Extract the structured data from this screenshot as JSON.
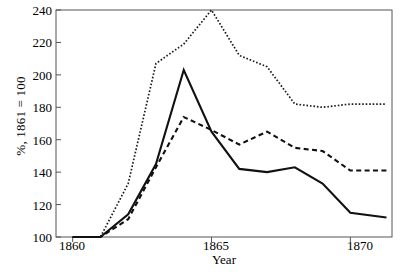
{
  "chart_data": {
    "type": "line",
    "title": "",
    "xlabel": "Year",
    "ylabel": "%, 1861 = 100",
    "xlim": [
      1859.4,
      1871.5
    ],
    "ylim": [
      96,
      243
    ],
    "grid": false,
    "legend": "none",
    "x_ticks": [
      1860,
      1865,
      1870
    ],
    "x_tick_labels": [
      "1860",
      "1865",
      "1870"
    ],
    "y_ticks": [
      100,
      120,
      140,
      160,
      180,
      200,
      220,
      240
    ],
    "y_tick_labels": [
      "100",
      "120",
      "140",
      "160",
      "180",
      "200",
      "220",
      "240"
    ],
    "x": [
      1860,
      1861,
      1862,
      1863,
      1864,
      1865,
      1866,
      1867,
      1868,
      1869,
      1870,
      1871.3
    ],
    "series": [
      {
        "name": "dotted-series",
        "style": "dotted",
        "color": "#1a1a1a",
        "values": [
          100,
          100,
          133,
          207,
          219,
          240,
          212,
          205,
          182,
          180,
          182,
          182
        ]
      },
      {
        "name": "solid-series",
        "style": "solid",
        "color": "#111111",
        "values": [
          100,
          100,
          114,
          145,
          203,
          165,
          142,
          140,
          143,
          133,
          115,
          112
        ]
      },
      {
        "name": "dashed-series",
        "style": "dashed",
        "color": "#111111",
        "values": [
          100,
          100,
          111,
          143,
          174,
          166,
          157,
          165,
          155,
          153,
          141,
          141
        ]
      }
    ]
  },
  "axes": {
    "frame_color": "#555555"
  }
}
